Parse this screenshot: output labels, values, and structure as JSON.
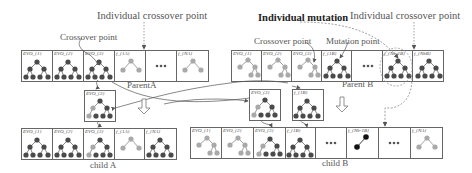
{
  "labels": {
    "individual_crossover_point_left": "Individual crossover point",
    "individual_mutation": "Individual mutation",
    "individual_crossover_point_right": "Individual crossover point",
    "crossover_point_left": "Crossover point",
    "crossover_point_right": "Crossover point",
    "mutation_point": "Mutation point",
    "parent_a": "ParentA",
    "parent_b": "Parent B",
    "child_a": "child A",
    "child_b": "child B"
  },
  "parent_a": {
    "cells": [
      {
        "caption": "EVO_{1}",
        "tree": "dark-full"
      },
      {
        "caption": "EVO_{2}",
        "tree": "dark-full"
      },
      {
        "caption": "EVO_{3}",
        "tree": "dark-full"
      },
      {
        "caption": "f_{1A}",
        "tree": "light-small"
      },
      {
        "caption": "•••",
        "tree": "ellipsis"
      },
      {
        "caption": "f_{NA}",
        "tree": "light-small"
      }
    ]
  },
  "parent_b": {
    "cells": [
      {
        "caption": "EVO_{1}",
        "tree": "light-full"
      },
      {
        "caption": "EVO_{2}",
        "tree": "light-full"
      },
      {
        "caption": "EVO_{3}",
        "tree": "light-full"
      },
      {
        "caption": "f_{1B}",
        "tree": "dark-full"
      },
      {
        "caption": "•••",
        "tree": "ellipsis"
      },
      {
        "caption": "f_{Nb-1B}",
        "tree": "dark-full"
      },
      {
        "caption": "f_{NbB}",
        "tree": "dark-full"
      }
    ]
  },
  "detached": {
    "evo3_a": {
      "caption": "EVO_{3}"
    },
    "evo3_b": {
      "caption": "EVO_{3}"
    },
    "f1b": {
      "caption": "f_{1B}"
    }
  },
  "child_a": {
    "cells": [
      {
        "caption": "EVO_{1}",
        "tree": "dark-full"
      },
      {
        "caption": "EVO_{2}",
        "tree": "dark-full"
      },
      {
        "caption": "EVO_{3}",
        "tree": "mixed"
      },
      {
        "caption": "f_{1A}",
        "tree": "light-small"
      },
      {
        "caption": "f_{NA}",
        "tree": "dark-full"
      }
    ]
  },
  "child_b": {
    "cells": [
      {
        "caption": "EVO_{1}",
        "tree": "light-full"
      },
      {
        "caption": "EVO_{2}",
        "tree": "light-full"
      },
      {
        "caption": "EVO_{3}",
        "tree": "mixed"
      },
      {
        "caption": "f_{1B}",
        "tree": "dark-full"
      },
      {
        "caption": "•••",
        "tree": "ellipsis"
      },
      {
        "caption": "f_{Nb-1B}",
        "tree": "black-line"
      },
      {
        "caption": "•••",
        "tree": "ellipsis"
      },
      {
        "caption": "f_{NA}",
        "tree": "light-small"
      }
    ]
  },
  "colors": {
    "dark_node": "#4a4a4a",
    "light_node": "#a9a9a9",
    "black_node": "#111111",
    "border": "#666666",
    "dashed": "#888888"
  }
}
